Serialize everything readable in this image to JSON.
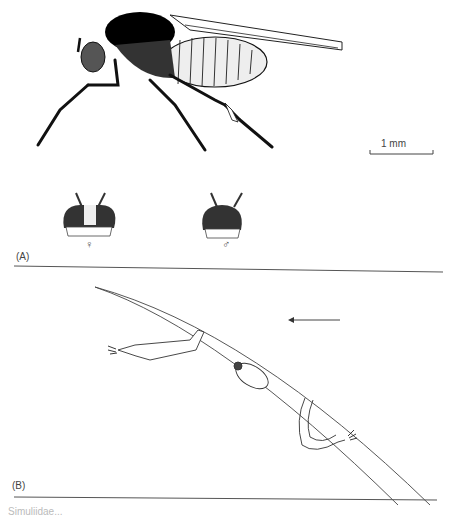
{
  "figure": {
    "panel_a": {
      "label": "(A)",
      "scale_bar": "1 mm",
      "head_female_symbol": "♀",
      "head_male_symbol": "♂"
    },
    "panel_b": {
      "label": "(B)"
    },
    "caption_partial": "Simuliidae..."
  }
}
